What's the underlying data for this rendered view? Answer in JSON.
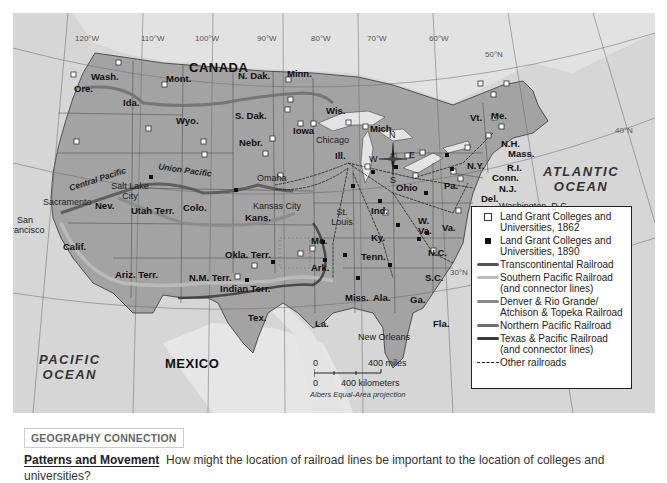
{
  "map": {
    "graticule": {
      "longitudes": [
        "120°W",
        "110°W",
        "100°W",
        "90°W",
        "80°W",
        "70°W",
        "60°W"
      ],
      "latitudes": [
        "50°N",
        "40°N",
        "30°N"
      ]
    },
    "countries": [
      "CANADA",
      "MEXICO"
    ],
    "oceans": {
      "pacific": [
        "PACIFIC",
        "OCEAN"
      ],
      "atlantic": [
        "ATLANTIC",
        "OCEAN"
      ]
    },
    "states": [
      "Wash.",
      "Ore.",
      "Calif.",
      "Nev.",
      "Ida.",
      "Mont.",
      "Wyo.",
      "Utah Terr.",
      "Colo.",
      "Ariz. Terr.",
      "N.M. Terr.",
      "N. Dak.",
      "S. Dak.",
      "Nebr.",
      "Kans.",
      "Okla. Terr.",
      "Indian Terr.",
      "Tex.",
      "Minn.",
      "Iowa",
      "Mo.",
      "Ark.",
      "La.",
      "Wis.",
      "Ill.",
      "Mich.",
      "Ind.",
      "Ohio",
      "Ky.",
      "Tenn.",
      "Miss.",
      "Ala.",
      "Ga.",
      "Fla.",
      "S.C.",
      "N.C.",
      "Va.",
      "W. Va.",
      "Pa.",
      "N.Y.",
      "Vt.",
      "Me.",
      "N.H.",
      "Mass.",
      "R.I.",
      "Conn.",
      "N.J.",
      "Del.",
      "Md."
    ],
    "cities": [
      "San Francisco",
      "Sacramento",
      "Salt Lake City",
      "Omaha",
      "Kansas City",
      "Chicago",
      "St. Louis",
      "New Orleans",
      "Washington, D.C."
    ],
    "railroad_labels": [
      "Central Pacific",
      "Union Pacific"
    ],
    "compass": {
      "n": "N",
      "s": "S",
      "e": "E",
      "w": "W"
    },
    "scale": {
      "zero_top": "0",
      "miles": "400 miles",
      "zero_bottom": "0",
      "km": "400 kilometers",
      "projection": "Albers Equal-Area projection"
    }
  },
  "legend": {
    "items": [
      {
        "symbol": "open-square",
        "label": "Land Grant Colleges and Universities, 1862"
      },
      {
        "symbol": "filled-square",
        "label": "Land Grant Colleges and Universities, 1890"
      },
      {
        "symbol": "line",
        "color": "#555555",
        "label": "Transcontinental Railroad"
      },
      {
        "symbol": "line",
        "color": "#bdbdbd",
        "label": "Southern Pacific Railroad (and connector lines)"
      },
      {
        "symbol": "line",
        "color": "#8a8a8a",
        "label": "Denver & Rio Grande/ Atchison & Topeka Railroad"
      },
      {
        "symbol": "line",
        "color": "#6e6e6e",
        "label": "Northern Pacific Railroad"
      },
      {
        "symbol": "line",
        "color": "#3a3a3a",
        "label": "Texas & Pacific Railroad (and connector lines)"
      },
      {
        "symbol": "dashed-line",
        "label": "Other railroads"
      }
    ]
  },
  "caption": {
    "tag": "GEOGRAPHY CONNECTION",
    "title": "Patterns and Movement",
    "question": "How might the location of railroad lines be important to the location of colleges and universities?"
  },
  "colors": {
    "land_us": "#9e9e9e",
    "land_other": "#dedede",
    "water": "#d4d4d4",
    "lakes": "#e4e4e4"
  }
}
